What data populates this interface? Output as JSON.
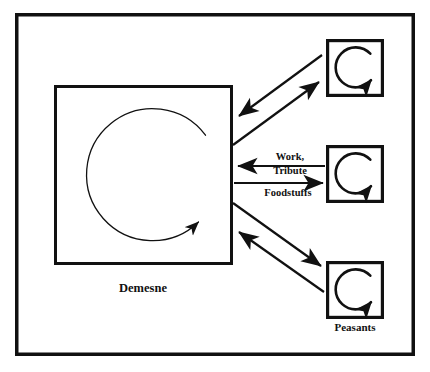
{
  "diagram": {
    "background_color": "#ffffff",
    "stroke_color": "#111111",
    "outer_frame": {
      "name": "manor-frame",
      "x": 15,
      "y": 13,
      "width": 400,
      "height": 343,
      "stroke_width": 3.5
    },
    "nodes": [
      {
        "id": "demesne",
        "label": "Demesne",
        "label_x": 143,
        "label_y": 292,
        "label_size": 12.5,
        "box": {
          "x": 54,
          "y": 85,
          "width": 179,
          "height": 180,
          "stroke_width": 3
        },
        "cycle": {
          "cx": 146,
          "cy": 176,
          "r": 66,
          "stroke_width": 1.3,
          "gap_deg": 26
        }
      },
      {
        "id": "peasant-top",
        "label": "",
        "box": {
          "x": 326,
          "y": 39,
          "width": 58,
          "height": 58,
          "stroke_width": 3.2
        },
        "cycle": {
          "cx": 355,
          "cy": 68,
          "r": 20,
          "stroke_width": 2.6,
          "gap_deg": 40
        }
      },
      {
        "id": "peasant-middle",
        "label": "",
        "box": {
          "x": 326,
          "y": 145,
          "width": 58,
          "height": 58,
          "stroke_width": 3.2
        },
        "cycle": {
          "cx": 355,
          "cy": 174,
          "r": 20,
          "stroke_width": 2.6,
          "gap_deg": 40
        }
      },
      {
        "id": "peasant-bottom",
        "label": "Peasants",
        "label_x": 355,
        "label_y": 330,
        "label_size": 11,
        "box": {
          "x": 326,
          "y": 261,
          "width": 58,
          "height": 58,
          "stroke_width": 3.2
        },
        "cycle": {
          "cx": 355,
          "cy": 290,
          "r": 20,
          "stroke_width": 2.6,
          "gap_deg": 40
        }
      }
    ],
    "flows": [
      {
        "id": "top-inbound",
        "from": "peasant-top",
        "to": "demesne",
        "label": "",
        "x1": 322,
        "y1": 55,
        "x2": 237,
        "y2": 118,
        "stroke_width": 2.2
      },
      {
        "id": "top-outbound",
        "from": "demesne",
        "to": "peasant-top",
        "label": "",
        "x1": 233,
        "y1": 145,
        "x2": 321,
        "y2": 80,
        "stroke_width": 2.2
      },
      {
        "id": "work-tribute",
        "from": "peasant-middle",
        "to": "demesne",
        "label": "Work,",
        "label2": "Tribute",
        "label_x": 290,
        "label_y": 160,
        "label2_x": 290,
        "label2_y": 173,
        "label_size": 10.5,
        "x1": 325,
        "y1": 166,
        "x2": 236,
        "y2": 166,
        "stroke_width": 2.2
      },
      {
        "id": "foodstuffs",
        "from": "demesne",
        "to": "peasant-middle",
        "label": "Foodstuffs",
        "label_x": 288,
        "label_y": 195,
        "label_size": 10.5,
        "x1": 234,
        "y1": 183,
        "x2": 325,
        "y2": 183,
        "stroke_width": 2.2
      },
      {
        "id": "bottom-outbound",
        "from": "demesne",
        "to": "peasant-bottom",
        "label": "",
        "x1": 233,
        "y1": 203,
        "x2": 323,
        "y2": 268,
        "stroke_width": 2.2
      },
      {
        "id": "bottom-inbound",
        "from": "peasant-bottom",
        "to": "demesne",
        "label": "",
        "x1": 324,
        "y1": 292,
        "x2": 237,
        "y2": 230,
        "stroke_width": 2.2
      }
    ]
  }
}
